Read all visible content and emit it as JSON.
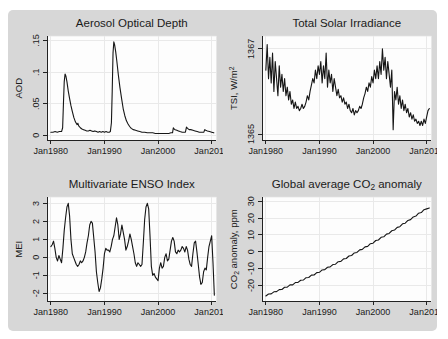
{
  "page": {
    "colors": {
      "page_background": "#ffffff",
      "panel_background": "#d7d7d7",
      "plot_background": "#fdfdfd",
      "gridline": "#e9e9e9",
      "axis": "#222222",
      "line": "#161616",
      "text": "#1a1a1a"
    }
  },
  "chart_data": [
    {
      "id": "aerosol-optical-depth",
      "type": "line",
      "title_parts": [
        [
          "Aerosol Optical Depth",
          0
        ]
      ],
      "ylabel_parts": [
        [
          "AOD",
          0
        ]
      ],
      "xlim": [
        1979.3,
        2010.9
      ],
      "ylim": [
        -0.008,
        0.157
      ],
      "xticks": [
        1980,
        1990,
        2000,
        2010
      ],
      "xtick_labels": [
        "Jan1980",
        "Jan1990",
        "Jan2000",
        "Jan2010"
      ],
      "yticks": [
        0,
        0.05,
        0.1,
        0.15
      ],
      "ytick_labels": [
        "0",
        ".05",
        ".1",
        ".15"
      ],
      "grid": true,
      "x": [
        1980.0,
        1980.4,
        1980.8,
        1981.2,
        1981.6,
        1982.0,
        1982.2,
        1982.35,
        1982.5,
        1982.65,
        1982.8,
        1983.0,
        1983.25,
        1983.5,
        1983.75,
        1984.0,
        1984.3,
        1984.6,
        1984.9,
        1985.05,
        1985.2,
        1985.5,
        1985.8,
        1986.1,
        1986.4,
        1986.7,
        1987.0,
        1987.3,
        1987.6,
        1987.9,
        1988.2,
        1988.5,
        1988.8,
        1989.1,
        1989.4,
        1989.7,
        1990.0,
        1990.3,
        1990.6,
        1990.9,
        1991.1,
        1991.3,
        1991.45,
        1991.6,
        1991.75,
        1991.9,
        1992.1,
        1992.3,
        1992.6,
        1992.9,
        1993.2,
        1993.5,
        1993.8,
        1994.1,
        1994.4,
        1994.7,
        1995.0,
        1995.4,
        1995.8,
        1996.2,
        1996.6,
        1997.0,
        1997.5,
        1998.0,
        1998.5,
        1999.0,
        1999.5,
        2000.0,
        2000.5,
        2001.0,
        2001.5,
        2002.0,
        2002.4,
        2002.7,
        2002.85,
        2003.0,
        2003.2,
        2003.5,
        2003.8,
        2004.1,
        2004.5,
        2004.9,
        2005.1,
        2005.3,
        2005.5,
        2005.8,
        2006.1,
        2006.5,
        2006.9,
        2007.3,
        2007.7,
        2008.0,
        2008.3,
        2008.55,
        2008.7,
        2008.9,
        2009.2,
        2009.6,
        2010.0,
        2010.4
      ],
      "y": [
        0.005,
        0.005,
        0.006,
        0.005,
        0.006,
        0.006,
        0.012,
        0.05,
        0.085,
        0.097,
        0.094,
        0.085,
        0.07,
        0.058,
        0.047,
        0.038,
        0.028,
        0.021,
        0.017,
        0.019,
        0.015,
        0.012,
        0.01,
        0.009,
        0.008,
        0.007,
        0.007,
        0.008,
        0.007,
        0.006,
        0.007,
        0.006,
        0.005,
        0.006,
        0.005,
        0.006,
        0.005,
        0.006,
        0.005,
        0.005,
        0.006,
        0.02,
        0.07,
        0.13,
        0.148,
        0.143,
        0.132,
        0.118,
        0.095,
        0.075,
        0.058,
        0.042,
        0.031,
        0.023,
        0.018,
        0.014,
        0.011,
        0.009,
        0.008,
        0.007,
        0.006,
        0.005,
        0.005,
        0.004,
        0.004,
        0.004,
        0.003,
        0.003,
        0.003,
        0.003,
        0.003,
        0.003,
        0.004,
        0.004,
        0.012,
        0.01,
        0.009,
        0.008,
        0.007,
        0.006,
        0.005,
        0.005,
        0.005,
        0.013,
        0.011,
        0.009,
        0.009,
        0.008,
        0.007,
        0.006,
        0.005,
        0.005,
        0.005,
        0.005,
        0.009,
        0.008,
        0.007,
        0.006,
        0.005,
        0.004
      ]
    },
    {
      "id": "total-solar-irradiance",
      "type": "line",
      "title_parts": [
        [
          "Total Solar Irradiance",
          0
        ]
      ],
      "ylabel_parts": [
        [
          "TSI, W/m",
          0
        ],
        [
          "2",
          1
        ]
      ],
      "xlim": [
        1979.3,
        2010.9
      ],
      "ylim": [
        1364.85,
        1367.3
      ],
      "xticks": [
        1980,
        1990,
        2000,
        2010
      ],
      "xtick_labels": [
        "Jan1980",
        "Jan1990",
        "Jan2000",
        "Jan2010"
      ],
      "yticks": [
        1365,
        1367
      ],
      "ytick_labels": [
        "1365",
        "1367"
      ],
      "grid": true,
      "x_start": 1980.0,
      "x_step": 0.25,
      "y": [
        1366.5,
        1367.1,
        1366.3,
        1366.8,
        1366.2,
        1366.9,
        1366.0,
        1366.7,
        1366.3,
        1365.9,
        1366.6,
        1366.1,
        1366.4,
        1366.0,
        1366.3,
        1365.9,
        1366.1,
        1365.8,
        1366.0,
        1365.7,
        1365.8,
        1365.6,
        1365.75,
        1365.6,
        1365.65,
        1365.55,
        1365.6,
        1365.7,
        1365.6,
        1365.65,
        1365.75,
        1365.9,
        1365.8,
        1366.0,
        1366.15,
        1366.3,
        1366.2,
        1366.5,
        1366.3,
        1366.6,
        1366.4,
        1366.7,
        1366.2,
        1366.6,
        1366.3,
        1366.9,
        1366.1,
        1366.5,
        1366.2,
        1366.4,
        1366.0,
        1366.3,
        1366.1,
        1365.9,
        1366.05,
        1365.85,
        1365.9,
        1365.75,
        1365.85,
        1365.7,
        1365.75,
        1365.6,
        1365.7,
        1365.55,
        1365.5,
        1365.6,
        1365.45,
        1365.55,
        1365.5,
        1365.55,
        1365.65,
        1365.6,
        1365.7,
        1365.85,
        1365.95,
        1366.1,
        1366.0,
        1366.2,
        1366.1,
        1366.35,
        1366.2,
        1366.5,
        1366.3,
        1366.6,
        1366.3,
        1366.7,
        1366.4,
        1367.0,
        1366.5,
        1366.8,
        1366.3,
        1366.7,
        1366.4,
        1366.1,
        1366.5,
        1365.1,
        1366.0,
        1365.8,
        1366.1,
        1365.7,
        1365.9,
        1365.6,
        1365.8,
        1365.55,
        1365.7,
        1365.5,
        1365.6,
        1365.4,
        1365.5,
        1365.35,
        1365.45,
        1365.3,
        1365.35,
        1365.25,
        1365.3,
        1365.2,
        1365.3,
        1365.2,
        1365.35,
        1365.25,
        1365.4,
        1365.55,
        1365.6
      ]
    },
    {
      "id": "multivariate-enso-index",
      "type": "line",
      "title_parts": [
        [
          "Multivariate ENSO Index",
          0
        ]
      ],
      "ylabel_parts": [
        [
          "MEI",
          0
        ]
      ],
      "xlim": [
        1979.3,
        2010.9
      ],
      "ylim": [
        -2.45,
        3.35
      ],
      "xticks": [
        1980,
        1990,
        2000,
        2010
      ],
      "xtick_labels": [
        "Jan1980",
        "Jan1990",
        "Jan2000",
        "Jan2010"
      ],
      "yticks": [
        -2,
        -1,
        0,
        1,
        2,
        3
      ],
      "ytick_labels": [
        "-2",
        "-1",
        "0",
        "1",
        "2",
        "3"
      ],
      "grid": true,
      "x_start": 1980.0,
      "x_step": 0.25,
      "y": [
        0.6,
        0.7,
        0.9,
        0.5,
        0.0,
        -0.2,
        0.1,
        -0.1,
        -0.3,
        0.5,
        1.5,
        2.2,
        2.8,
        3.0,
        2.3,
        1.0,
        0.2,
        0.0,
        -0.2,
        -0.4,
        -0.5,
        -0.4,
        -0.2,
        -0.3,
        -0.2,
        0.0,
        0.3,
        0.8,
        1.2,
        1.8,
        2.0,
        1.9,
        1.1,
        0.3,
        -0.8,
        -1.4,
        -1.9,
        -1.7,
        -1.2,
        -0.6,
        0.2,
        0.5,
        0.4,
        0.4,
        0.3,
        0.6,
        1.0,
        1.2,
        1.7,
        2.2,
        1.8,
        1.0,
        1.3,
        1.8,
        1.4,
        1.0,
        0.4,
        0.6,
        0.9,
        1.3,
        1.0,
        0.6,
        0.2,
        -0.3,
        -0.5,
        -0.3,
        -0.4,
        -0.5,
        -0.4,
        0.8,
        2.1,
        2.8,
        3.0,
        2.7,
        1.2,
        -0.5,
        -1.0,
        -0.9,
        -1.1,
        -1.2,
        -1.3,
        -0.6,
        -0.3,
        -0.6,
        -0.5,
        0.0,
        0.2,
        -0.2,
        -0.1,
        0.4,
        0.9,
        1.1,
        0.9,
        0.3,
        0.2,
        0.4,
        0.3,
        0.4,
        0.6,
        0.5,
        0.3,
        0.6,
        0.4,
        -0.1,
        -0.4,
        -0.5,
        0.2,
        0.8,
        0.9,
        0.3,
        -0.4,
        -1.1,
        -1.5,
        -1.4,
        -0.8,
        -0.6,
        -0.7,
        0.0,
        0.6,
        0.9,
        1.2,
        -0.3,
        -2.1
      ]
    },
    {
      "id": "global-co2-anomaly",
      "type": "line",
      "title_parts": [
        [
          "Global average CO",
          0
        ],
        [
          "2",
          -1
        ],
        [
          " anomaly",
          0
        ]
      ],
      "ylabel_parts": [
        [
          "CO",
          0
        ],
        [
          "2",
          -1
        ],
        [
          " anomaly, ppm",
          0
        ]
      ],
      "xlim": [
        1979.3,
        2010.9
      ],
      "ylim": [
        -29.5,
        32.5
      ],
      "xticks": [
        1980,
        1990,
        2000,
        2010
      ],
      "xtick_labels": [
        "Jan1980",
        "Jan1990",
        "Jan2000",
        "Jan2010"
      ],
      "yticks": [
        -20,
        -10,
        0,
        10,
        20,
        30
      ],
      "ytick_labels": [
        "-20",
        "-10",
        "0",
        "10",
        "20",
        "30"
      ],
      "grid": true,
      "x_start": 1980.0,
      "x_step": 0.5,
      "y": [
        -26.3,
        -25.1,
        -25.0,
        -23.8,
        -23.7,
        -22.5,
        -22.4,
        -21.1,
        -21.0,
        -19.7,
        -19.7,
        -18.3,
        -18.2,
        -16.9,
        -16.8,
        -15.4,
        -15.3,
        -13.9,
        -13.8,
        -12.4,
        -12.2,
        -10.8,
        -10.6,
        -9.2,
        -9.0,
        -7.6,
        -7.4,
        -5.9,
        -5.7,
        -4.2,
        -4.0,
        -2.5,
        -2.2,
        -0.7,
        -0.4,
        1.1,
        1.4,
        2.9,
        3.2,
        4.8,
        5.1,
        6.7,
        7.0,
        8.6,
        8.9,
        10.5,
        10.9,
        12.5,
        12.9,
        14.5,
        14.9,
        16.6,
        17.0,
        18.6,
        19.1,
        20.7,
        21.2,
        22.9,
        23.3,
        25.0,
        25.5,
        26.0
      ]
    }
  ]
}
